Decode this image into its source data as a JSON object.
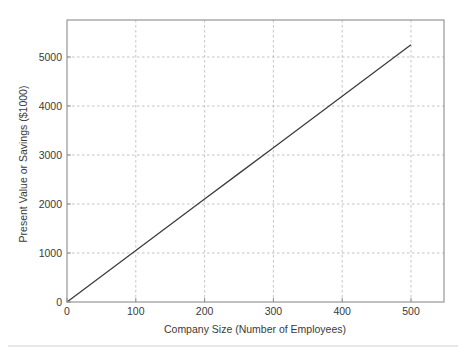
{
  "chart_data": {
    "type": "line",
    "title": "",
    "subtitle": "",
    "xlabel": "Company Size (Number of Employees)",
    "ylabel": "Present Value or Savings ($1000)",
    "xlim": [
      0,
      548
    ],
    "ylim": [
      0,
      5755
    ],
    "xticks": [
      0,
      100,
      200,
      300,
      400,
      500
    ],
    "xtick_labels": [
      "0",
      "100",
      "200",
      "300",
      "400",
      "500"
    ],
    "yticks": [
      0,
      1000,
      2000,
      3000,
      4000,
      5000
    ],
    "ytick_labels": [
      "0",
      "1000",
      "2000",
      "3000",
      "4000",
      "5000"
    ],
    "grid": true,
    "grid_style": "dashed",
    "legend": null,
    "legend_position": "none",
    "annotations": [],
    "series": [
      {
        "name": "Present Value or Savings",
        "color": "#3d3d3d",
        "x": [
          0,
          50,
          100,
          150,
          200,
          250,
          300,
          350,
          400,
          450,
          500
        ],
        "values": [
          0,
          525,
          1050,
          1575,
          2100,
          2625,
          3150,
          3675,
          4200,
          4725,
          5250
        ]
      }
    ]
  },
  "axis": {
    "x_tick_labels": [
      "0",
      "100",
      "200",
      "300",
      "400",
      "500"
    ],
    "y_tick_labels": [
      "0",
      "1000",
      "2000",
      "3000",
      "4000",
      "5000"
    ],
    "x_title": "Company Size (Number of Employees)",
    "y_title": "Present Value or Savings ($1000)"
  },
  "colors": {
    "line": "#3d3d3d",
    "grid": "#bdbdbd",
    "frame": "#8c8c8c",
    "text": "#3a3a3a",
    "background": "#ffffff",
    "footer_rule": "#d2d2d2"
  }
}
